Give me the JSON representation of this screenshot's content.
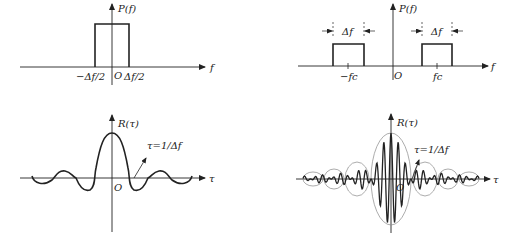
{
  "panels": {
    "baseband_psd": {
      "y_label": "P(f)",
      "x_label": "f",
      "origin": "O",
      "tick_left": "−Δf/2",
      "tick_right": "Δf/2"
    },
    "bandpass_psd": {
      "y_label": "P(f)",
      "x_label": "f",
      "origin": "O",
      "tick_left": "−fc",
      "tick_right": "fc",
      "bandwidth_left": "Δf",
      "bandwidth_right": "Δf"
    },
    "baseband_autocorr": {
      "y_label": "R(τ)",
      "x_label": "τ",
      "origin": "O",
      "annotation": "τ=1/Δf"
    },
    "bandpass_autocorr": {
      "y_label": "R(τ)",
      "x_label": "τ",
      "origin": "O",
      "annotation": "τ=1/Δf"
    }
  },
  "colors": {
    "ink": "#222222",
    "envelope": "#888888",
    "background": "#ffffff"
  }
}
